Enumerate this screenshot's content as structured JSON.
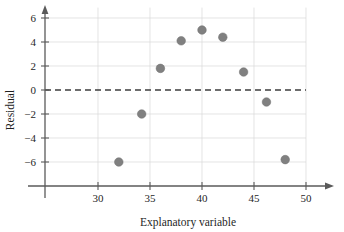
{
  "chart_data": {
    "type": "scatter",
    "title": "",
    "xlabel": "Explanatory variable",
    "ylabel": "Residual",
    "xlim": [
      26.5,
      52
    ],
    "ylim": [
      -7.6,
      7.2
    ],
    "xticks": [
      30,
      35,
      40,
      45,
      50
    ],
    "xtick_labels": [
      "30",
      "35",
      "40",
      "45",
      "50"
    ],
    "yticks": [
      -6,
      -4,
      -2,
      0,
      2,
      4,
      6
    ],
    "ytick_labels": [
      "−6",
      "−4",
      "−2",
      "0",
      "2",
      "4",
      "6"
    ],
    "grid": true,
    "legend": "none",
    "reference_line": {
      "type": "horizontal",
      "y": 0,
      "style": "dashed",
      "color": "#3c3c3c"
    },
    "marker": {
      "shape": "circle",
      "color": "#808080",
      "size": 4.3
    },
    "points": [
      {
        "x": 32.0,
        "y": -6.0
      },
      {
        "x": 34.2,
        "y": -2.0
      },
      {
        "x": 36.0,
        "y": 1.8
      },
      {
        "x": 38.0,
        "y": 4.1
      },
      {
        "x": 40.0,
        "y": 5.0
      },
      {
        "x": 42.0,
        "y": 4.4
      },
      {
        "x": 44.0,
        "y": 1.5
      },
      {
        "x": 46.2,
        "y": -1.0
      },
      {
        "x": 48.0,
        "y": -5.8
      }
    ]
  },
  "colors": {
    "background": "#ffffff",
    "axis": "#5a5a5a",
    "grid": "#d8d8d8",
    "marker": "#808080",
    "zero_line": "#3c3c3c",
    "text": "#1f1f1f"
  }
}
